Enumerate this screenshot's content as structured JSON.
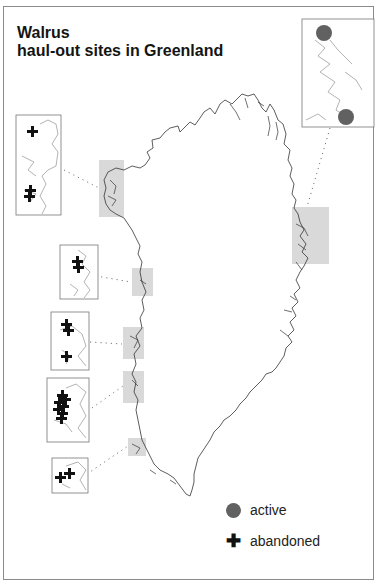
{
  "title": {
    "line1": "Walrus",
    "line2": "haul-out sites in Greenland"
  },
  "legend": {
    "items": [
      {
        "symbol": "filled-circle",
        "label": "active",
        "color": "#616161"
      },
      {
        "symbol": "plus",
        "label": "abandoned",
        "glyph": "✚",
        "color": "#111111"
      }
    ]
  },
  "colors": {
    "highlight": "#d9d9d9",
    "coastline": "#333333",
    "inset_coast": "#a0a0a0",
    "frame": "#8a8a8a",
    "active": "#616161",
    "abandoned": "#111111"
  },
  "regions": [
    {
      "id": "northwest",
      "status": "abandoned",
      "marker_count": 3
    },
    {
      "id": "west-central-1",
      "status": "abandoned",
      "marker_count": 2
    },
    {
      "id": "west-central-2",
      "status": "abandoned",
      "marker_count": 3
    },
    {
      "id": "west-central-3",
      "status": "abandoned",
      "marker_count": 8
    },
    {
      "id": "southwest",
      "status": "abandoned",
      "marker_count": 2
    },
    {
      "id": "northeast",
      "status": "active",
      "marker_count": 2
    }
  ]
}
